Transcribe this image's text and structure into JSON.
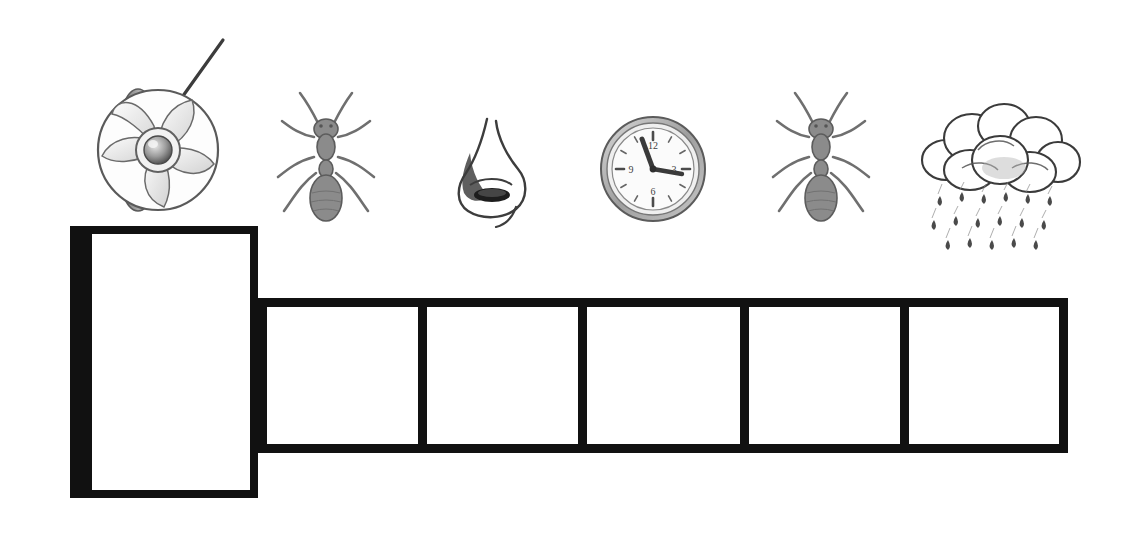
{
  "worksheet": {
    "title": "Picture word worksheet",
    "background_color": "#ffffff",
    "line_color": "#111111",
    "width": 1127,
    "height": 542
  },
  "picture_strip": {
    "name": "picture-cue-row",
    "count": 6,
    "cues": [
      {
        "id": "cue-1",
        "icon": "fan-icon",
        "label": "fan",
        "description": "pencil drawing of an electric fan with curved blades, round hub and a handle rod angled up to the right",
        "x": 145,
        "y": 160,
        "width": 130,
        "height": 200
      },
      {
        "id": "cue-2",
        "icon": "ant-icon",
        "label": "ant",
        "description": "pencil drawing of an ant seen from above with antennae and six legs",
        "x": 325,
        "y": 163,
        "width": 110,
        "height": 140
      },
      {
        "id": "cue-3",
        "icon": "nose-icon",
        "label": "nose",
        "description": "pencil drawing of a nose in profile with one nostril",
        "x": 492,
        "y": 172,
        "width": 105,
        "height": 120
      },
      {
        "id": "cue-4",
        "icon": "clock-icon",
        "label": "clock",
        "description": "pencil drawing of a round wall clock",
        "x": 652,
        "y": 170,
        "width": 105,
        "height": 110,
        "clock_face": {
          "numerals": [
            "12",
            "3",
            "6",
            "9"
          ],
          "hour_hand_points_to": "11",
          "minute_hand_points_to": "3",
          "reading": "11:15"
        }
      },
      {
        "id": "cue-5",
        "icon": "ant-icon",
        "label": "ant",
        "description": "pencil drawing of an ant seen from above with antennae and six legs",
        "x": 820,
        "y": 163,
        "width": 110,
        "height": 140
      },
      {
        "id": "cue-6",
        "icon": "rain-cloud-icon",
        "label": "rain",
        "description": "pencil drawing of a cloud with falling raindrops",
        "x": 995,
        "y": 175,
        "width": 160,
        "height": 170
      }
    ]
  },
  "answer_area": {
    "name": "answer-boxes",
    "first_box": {
      "id": "answer-box-large",
      "value": "",
      "placeholder": "",
      "x": 70,
      "y": 226,
      "width": 188,
      "height": 272,
      "border_width": 8,
      "left_border_width": 22
    },
    "letter_row": {
      "id": "letter-box-row",
      "x": 258,
      "y": 298,
      "width": 810,
      "height": 155,
      "border_width": 9,
      "cells": [
        {
          "id": "letter-cell-1",
          "value": "",
          "left": 0,
          "width": 160
        },
        {
          "id": "letter-cell-2",
          "value": "",
          "left": 160,
          "width": 160
        },
        {
          "id": "letter-cell-3",
          "value": "",
          "left": 320,
          "width": 162
        },
        {
          "id": "letter-cell-4",
          "value": "",
          "left": 482,
          "width": 160
        },
        {
          "id": "letter-cell-5",
          "value": "",
          "left": 642,
          "width": 168
        }
      ]
    }
  }
}
